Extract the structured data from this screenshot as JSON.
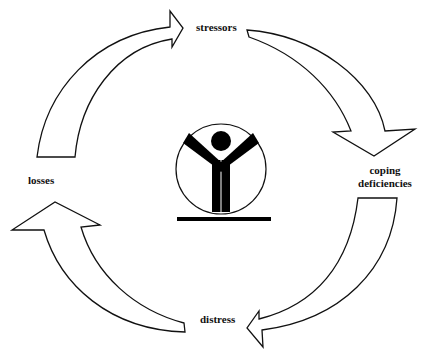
{
  "diagram": {
    "type": "cycle",
    "nodes": [
      {
        "id": "stressors",
        "label": "stressors"
      },
      {
        "id": "coping",
        "label_line1": "coping",
        "label_line2": "deficiencies"
      },
      {
        "id": "distress",
        "label": "distress"
      },
      {
        "id": "losses",
        "label": "losses"
      }
    ],
    "edges": [
      {
        "from": "losses",
        "to": "stressors"
      },
      {
        "from": "stressors",
        "to": "coping deficiencies"
      },
      {
        "from": "coping deficiencies",
        "to": "distress"
      },
      {
        "from": "distress",
        "to": "losses"
      }
    ],
    "center_icon": "person-in-circle-icon",
    "colors": {
      "stroke": "#111111",
      "fill": "#ffffff",
      "icon": "#000000"
    }
  }
}
